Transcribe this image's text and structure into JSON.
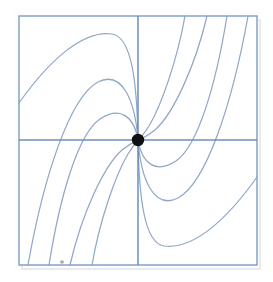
{
  "figure": {
    "canvas": {
      "width": 273,
      "height": 282
    },
    "background_color": "#ffffff",
    "paper_tint": "#fdfdfb"
  },
  "frame": {
    "name": "plot-border",
    "x": 19,
    "y": 16,
    "width": 238,
    "height": 249,
    "stroke": "#7d9cc4",
    "stroke_width": 1.4,
    "fill": "#ffffff"
  },
  "axes": {
    "stroke": "#6a8fc0",
    "stroke_width": 1.5,
    "origin": {
      "x": 138,
      "y": 140
    },
    "x_axis": {
      "label": "horizontal-axis",
      "x1": 19,
      "y1": 140,
      "x2": 257,
      "y2": 140
    },
    "y_axis": {
      "label": "vertical-axis",
      "x1": 138,
      "y1": 16,
      "x2": 138,
      "y2": 265
    }
  },
  "singular_point": {
    "label": "origin-node",
    "cx": 138,
    "cy": 140,
    "r": 6.2,
    "fill": "#111111"
  },
  "curve_style": {
    "stroke": "#8ba3c4",
    "stroke_width": 1.25,
    "fill": "none",
    "opacity": 0.95
  },
  "chart_data": {
    "type": "line",
    "xlabel": "",
    "ylabel": "",
    "grid": false,
    "legend": null,
    "axis_lines": [
      "x-axis at y=0",
      "y-axis at x=0"
    ],
    "symmetry": "180-degree rotational symmetry about the origin",
    "curve_count": 8,
    "series": [
      {
        "name": "outer-arc-upper-left-1",
        "quadrant": "upper-left",
        "path": "M 19,103 C 48,62 82,30 112,34 C 132,37 137,83 138,140"
      },
      {
        "name": "outer-arc-upper-left-2",
        "quadrant": "upper-left",
        "path": "M 28,265 C 44,175 70,97 98,82 C 122,70 135,100 138,140"
      },
      {
        "name": "outer-arc-upper-left-3",
        "quadrant": "upper-left",
        "path": "M 49,265 C 60,196 78,134 100,119 C 120,106 134,116 138,140"
      },
      {
        "name": "steep-curve-lower-left-1",
        "quadrant": "lower-left",
        "path": "M 70,265 C 82,213 104,166 122,150 C 131,143 136,141 138,140"
      },
      {
        "name": "steep-curve-lower-left-2",
        "quadrant": "lower-left",
        "path": "M 92,265 C 100,219 116,174 128,154 C 134,145 137,141 138,140"
      },
      {
        "name": "steep-curve-upper-right-1",
        "quadrant": "upper-right",
        "path": "M 138,140 C 140,139 143,135 149,126 C 161,106 177,61 185,16"
      },
      {
        "name": "steep-curve-upper-right-2",
        "quadrant": "upper-right",
        "path": "M 138,140 C 141,139 146,137 155,130 C 173,114 195,67 207,16"
      },
      {
        "name": "outer-arc-lower-right-1",
        "quadrant": "lower-right",
        "path": "M 138,140 C 142,164 156,174 176,161 C 198,146 216,84 227,16"
      },
      {
        "name": "outer-arc-lower-right-2",
        "quadrant": "lower-right",
        "path": "M 138,140 C 141,180 154,210 178,198 C 206,183 232,105 248,16"
      },
      {
        "name": "outer-arc-lower-right-3",
        "quadrant": "lower-right",
        "path": "M 138,140 C 139,197 144,243 164,246 C 194,250 228,218 257,177"
      }
    ]
  },
  "artifacts": [
    {
      "name": "scan-speck",
      "cx": 62,
      "cy": 262,
      "width": 4,
      "height": 3.5,
      "fill": "#9a9a92"
    }
  ]
}
